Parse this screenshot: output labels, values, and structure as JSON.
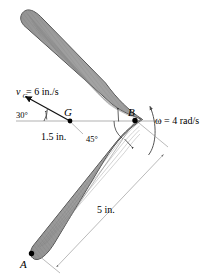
{
  "figure": {
    "body_label": "boomerang",
    "points": {
      "a": "A",
      "b": "B",
      "g": "G"
    },
    "labels": {
      "velocity_symbol": "v",
      "velocity_subscript": "G",
      "velocity_value": " = 6 in./s",
      "velocity_full": "v_G = 6 in./s",
      "omega": "ω = 4 rad/s",
      "angle_30": "30°",
      "angle_45": "45°",
      "dim_gb": "1.5 in.",
      "dim_ab": "5 in."
    },
    "values": {
      "velocity_magnitude": 6,
      "velocity_units": "in./s",
      "velocity_angle_deg": 30,
      "omega_magnitude": 4,
      "omega_units": "rad/s",
      "distance_g_to_b": 1.5,
      "distance_units_gb": "in.",
      "distance_a_to_b": 5,
      "distance_units_ab": "in.",
      "arm_angle_deg": 45
    },
    "colors": {
      "body_fill": "#9a9a9a",
      "body_stroke": "#2e2e2e",
      "dimension_line": "#8c8c8c",
      "vector_line": "#111111",
      "text": "#000000",
      "background": "#ffffff"
    },
    "icons": {
      "velocity_arrow": "arrow-up-left",
      "omega_arrow": "curved-arrow-counterclockwise",
      "dimension_arrow": "double-headed-arrow"
    }
  }
}
